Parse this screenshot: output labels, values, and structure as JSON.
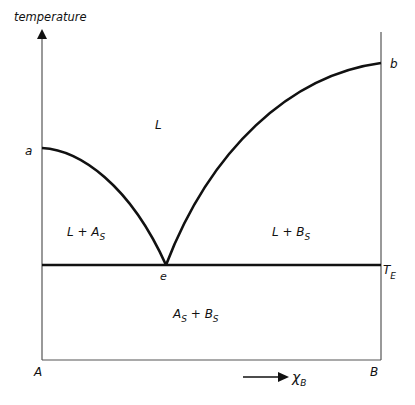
{
  "diagram": {
    "type": "binary eutectic phase diagram",
    "y_axis_label": "temperature",
    "x_axis_label": "χ",
    "x_axis_label_sub": "B",
    "component_left": "A",
    "component_right": "B",
    "point_a": "a",
    "point_b": "b",
    "point_e": "e",
    "eutectic_temp": "T",
    "eutectic_temp_sub": "E",
    "regions": {
      "liquid": "L",
      "left_two_phase": "L + A",
      "left_two_phase_sub": "S",
      "right_two_phase": "L + B",
      "right_two_phase_sub": "S",
      "solid_A": "A",
      "solid_A_sub": "S",
      "plus": " + ",
      "solid_B": "B",
      "solid_B_sub": "S"
    },
    "colors": {
      "line": "#111111",
      "axis": "#555555",
      "background": "#ffffff"
    }
  }
}
